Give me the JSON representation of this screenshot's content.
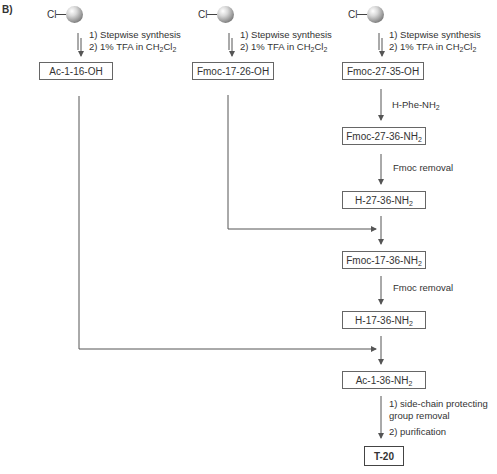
{
  "panel_label": "B)",
  "resin": {
    "atom": "Cl",
    "icon": "resin-bead-icon"
  },
  "columns": [
    {
      "start_box": "Ac-1-16-OH",
      "steps": [
        "1) Stepwise synthesis",
        "2) 1% TFA in CH2Cl2"
      ]
    },
    {
      "start_box": "Fmoc-17-26-OH",
      "steps": [
        "1) Stepwise synthesis",
        "2) 1% TFA in CH2Cl2"
      ]
    },
    {
      "start_box": "Fmoc-27-35-OH",
      "steps": [
        "1) Stepwise synthesis",
        "2) 1% TFA in CH2Cl2"
      ]
    }
  ],
  "step_text": {
    "s1": "1) Stepwise synthesis",
    "s2_prefix": "2) 1% TFA in CH",
    "s2_sub1": "2",
    "s2_mid": "Cl",
    "s2_sub2": "2"
  },
  "main_chain": {
    "reagent_1": {
      "main": "H-Phe-NH",
      "sub": "2"
    },
    "box_1": {
      "main": "Fmoc-27-36-NH",
      "sub": "2"
    },
    "reagent_2": "Fmoc removal",
    "box_2": {
      "main": "H-27-36-NH",
      "sub": "2"
    },
    "box_3": {
      "main": "Fmoc-17-36-NH",
      "sub": "2"
    },
    "reagent_3": "Fmoc removal",
    "box_4": {
      "main": "H-17-36-NH",
      "sub": "2"
    },
    "box_5": {
      "main": "Ac-1-36-NH",
      "sub": "2"
    },
    "final_steps": [
      "1) side-chain protecting",
      "group removal",
      "2) purification"
    ],
    "final_product": "T-20"
  }
}
